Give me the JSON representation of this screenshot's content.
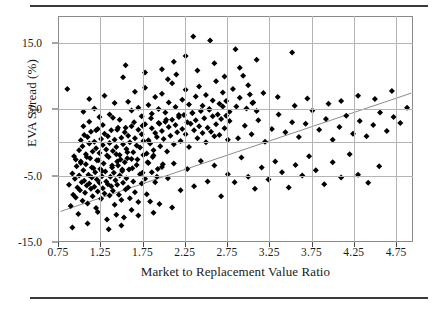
{
  "chart_data": {
    "type": "scatter",
    "title": "",
    "xlabel": "Market to Replacement Value Ratio",
    "ylabel": "EVA Spread (%)",
    "xlim": [
      0.75,
      4.95
    ],
    "ylim": [
      -15.0,
      19.0
    ],
    "grid": true,
    "legend": null,
    "xticks": [
      "0.75",
      "1.25",
      "1.75",
      "2.25",
      "2.75",
      "3.25",
      "3.75",
      "4.25",
      "4.75"
    ],
    "xtick_values": [
      0.75,
      1.25,
      1.75,
      2.25,
      2.75,
      3.25,
      3.75,
      4.25,
      4.75
    ],
    "yticks": [
      "15.0",
      "5.0",
      "-5.0",
      "-15.0"
    ],
    "ytick_values": [
      15.0,
      5.0,
      -5.0,
      -15.0
    ],
    "ygridlines": [
      15.0,
      5.0,
      -5.0
    ],
    "ygridline_unlabeled": [
      0.0
    ],
    "marker": "diamond",
    "marker_color": "#000000",
    "marker_size": 3,
    "trendline": {
      "type": "linear",
      "color": "#8c8c8c",
      "x_start": 0.78,
      "y_start": -10.4,
      "x_end": 4.93,
      "y_end": 7.4
    },
    "points": [
      [
        0.86,
        8.0
      ],
      [
        0.88,
        -6.4
      ],
      [
        0.9,
        -9.6
      ],
      [
        0.92,
        -4.7
      ],
      [
        0.93,
        -7.9
      ],
      [
        0.94,
        -2.1
      ],
      [
        0.95,
        -5.5
      ],
      [
        0.96,
        -8.3
      ],
      [
        0.97,
        -3.6
      ],
      [
        0.98,
        -6.8
      ],
      [
        0.99,
        -10.8
      ],
      [
        1.0,
        -5.0
      ],
      [
        1.01,
        -7.2
      ],
      [
        1.02,
        -2.9
      ],
      [
        1.03,
        -6.0
      ],
      [
        1.04,
        -8.8
      ],
      [
        1.05,
        -4.2
      ],
      [
        1.06,
        -5.8
      ],
      [
        1.07,
        -7.6
      ],
      [
        1.08,
        -3.3
      ],
      [
        1.09,
        -6.5
      ],
      [
        1.1,
        -9.2
      ],
      [
        1.11,
        -4.9
      ],
      [
        1.12,
        -6.2
      ],
      [
        1.13,
        -2.4
      ],
      [
        1.14,
        -7.0
      ],
      [
        1.15,
        -5.3
      ],
      [
        1.16,
        -8.1
      ],
      [
        1.17,
        -3.9
      ],
      [
        1.18,
        -6.7
      ],
      [
        1.19,
        -4.5
      ],
      [
        1.2,
        -9.9
      ],
      [
        1.21,
        -5.6
      ],
      [
        1.22,
        -7.4
      ],
      [
        1.23,
        -2.7
      ],
      [
        1.24,
        -6.1
      ],
      [
        1.25,
        -4.0
      ],
      [
        1.26,
        -8.5
      ],
      [
        1.27,
        -5.1
      ],
      [
        1.28,
        -6.9
      ],
      [
        1.29,
        -3.2
      ],
      [
        1.3,
        -7.7
      ],
      [
        1.31,
        -4.4
      ],
      [
        1.32,
        -5.9
      ],
      [
        1.33,
        -11.6
      ],
      [
        1.34,
        -6.3
      ],
      [
        1.35,
        -2.2
      ],
      [
        1.36,
        -8.0
      ],
      [
        1.37,
        -5.2
      ],
      [
        1.38,
        -6.6
      ],
      [
        1.39,
        -3.8
      ],
      [
        1.4,
        -7.3
      ],
      [
        1.41,
        -4.6
      ],
      [
        1.42,
        -9.4
      ],
      [
        1.43,
        -5.7
      ],
      [
        1.44,
        -1.8
      ],
      [
        1.45,
        -6.4
      ],
      [
        1.46,
        -3.5
      ],
      [
        1.47,
        -7.9
      ],
      [
        1.48,
        -5.0
      ],
      [
        1.49,
        -2.6
      ],
      [
        1.5,
        -8.7
      ],
      [
        1.51,
        -4.3
      ],
      [
        1.52,
        -6.1
      ],
      [
        1.53,
        -11.3
      ],
      [
        1.54,
        -3.0
      ],
      [
        1.55,
        -7.1
      ],
      [
        1.56,
        -5.4
      ],
      [
        1.57,
        -1.5
      ],
      [
        1.58,
        -6.8
      ],
      [
        1.59,
        -4.1
      ],
      [
        1.6,
        -8.4
      ],
      [
        1.62,
        -2.5
      ],
      [
        1.64,
        -5.9
      ],
      [
        1.66,
        -7.5
      ],
      [
        1.68,
        -3.4
      ],
      [
        1.7,
        -9.0
      ],
      [
        1.72,
        -4.8
      ],
      [
        1.74,
        -6.2
      ],
      [
        1.76,
        -1.9
      ],
      [
        1.78,
        -5.5
      ],
      [
        1.8,
        -7.8
      ],
      [
        1.82,
        -3.1
      ],
      [
        1.84,
        -8.9
      ],
      [
        1.86,
        -4.5
      ],
      [
        1.88,
        -2.0
      ],
      [
        1.9,
        -6.0
      ],
      [
        1.92,
        -5.2
      ],
      [
        1.95,
        -9.3
      ],
      [
        1.98,
        -3.7
      ],
      [
        1.0,
        -1.2
      ],
      [
        1.02,
        0.3
      ],
      [
        1.04,
        -0.6
      ],
      [
        1.06,
        1.1
      ],
      [
        1.08,
        -1.8
      ],
      [
        1.1,
        0.8
      ],
      [
        1.12,
        -0.2
      ],
      [
        1.14,
        1.6
      ],
      [
        1.16,
        -1.4
      ],
      [
        1.18,
        0.1
      ],
      [
        1.2,
        -0.9
      ],
      [
        1.22,
        2.0
      ],
      [
        1.24,
        -1.6
      ],
      [
        1.26,
        0.5
      ],
      [
        1.28,
        -0.4
      ],
      [
        1.3,
        1.3
      ],
      [
        1.32,
        -1.1
      ],
      [
        1.34,
        0.9
      ],
      [
        1.36,
        -0.1
      ],
      [
        1.38,
        1.8
      ],
      [
        1.4,
        -1.3
      ],
      [
        1.42,
        0.4
      ],
      [
        1.44,
        -0.7
      ],
      [
        1.46,
        2.2
      ],
      [
        1.48,
        -1.9
      ],
      [
        1.5,
        0.7
      ],
      [
        1.52,
        -0.3
      ],
      [
        1.54,
        1.5
      ],
      [
        1.56,
        -1.0
      ],
      [
        1.58,
        1.0
      ],
      [
        1.6,
        0.0
      ],
      [
        1.62,
        2.4
      ],
      [
        1.64,
        -1.5
      ],
      [
        1.66,
        0.6
      ],
      [
        1.68,
        -0.5
      ],
      [
        1.7,
        1.9
      ],
      [
        1.72,
        -0.8
      ],
      [
        1.74,
        1.2
      ],
      [
        1.76,
        0.2
      ],
      [
        1.78,
        2.7
      ],
      [
        1.8,
        -1.7
      ],
      [
        1.82,
        0.3
      ],
      [
        1.84,
        -0.2
      ],
      [
        1.86,
        2.1
      ],
      [
        1.88,
        -1.2
      ],
      [
        1.9,
        1.4
      ],
      [
        1.92,
        0.8
      ],
      [
        1.94,
        2.9
      ],
      [
        1.96,
        -0.6
      ],
      [
        1.98,
        1.7
      ],
      [
        2.0,
        0.5
      ],
      [
        2.02,
        3.1
      ],
      [
        2.04,
        -1.4
      ],
      [
        2.06,
        2.3
      ],
      [
        2.08,
        1.0
      ],
      [
        2.1,
        3.4
      ],
      [
        2.12,
        -0.3
      ],
      [
        2.14,
        2.6
      ],
      [
        2.16,
        1.5
      ],
      [
        2.18,
        3.8
      ],
      [
        2.2,
        0.2
      ],
      [
        2.22,
        2.0
      ],
      [
        2.24,
        4.1
      ],
      [
        2.26,
        1.2
      ],
      [
        2.28,
        3.0
      ],
      [
        2.3,
        -0.7
      ],
      [
        2.32,
        2.8
      ],
      [
        2.34,
        4.4
      ],
      [
        2.36,
        1.8
      ],
      [
        2.38,
        3.3
      ],
      [
        2.4,
        0.6
      ],
      [
        2.42,
        2.4
      ],
      [
        2.44,
        4.7
      ],
      [
        2.46,
        1.4
      ],
      [
        2.48,
        3.6
      ],
      [
        2.5,
        0.0
      ],
      [
        2.52,
        2.2
      ],
      [
        2.54,
        5.0
      ],
      [
        2.56,
        1.6
      ],
      [
        2.58,
        3.9
      ],
      [
        2.6,
        0.9
      ],
      [
        2.62,
        2.7
      ],
      [
        2.64,
        4.2
      ],
      [
        2.66,
        1.1
      ],
      [
        2.68,
        3.5
      ],
      [
        2.7,
        5.4
      ],
      [
        2.72,
        2.1
      ],
      [
        2.74,
        4.0
      ],
      [
        2.76,
        0.4
      ],
      [
        2.78,
        3.2
      ],
      [
        1.05,
        4.6
      ],
      [
        1.12,
        6.5
      ],
      [
        1.18,
        5.1
      ],
      [
        1.24,
        3.8
      ],
      [
        1.3,
        7.0
      ],
      [
        1.36,
        4.2
      ],
      [
        1.42,
        5.9
      ],
      [
        1.48,
        3.4
      ],
      [
        1.52,
        9.8
      ],
      [
        1.58,
        6.1
      ],
      [
        1.62,
        4.8
      ],
      [
        1.66,
        7.6
      ],
      [
        1.7,
        5.2
      ],
      [
        1.74,
        3.9
      ],
      [
        1.78,
        8.2
      ],
      [
        1.82,
        5.6
      ],
      [
        1.86,
        4.3
      ],
      [
        1.9,
        6.8
      ],
      [
        1.94,
        5.0
      ],
      [
        1.98,
        7.3
      ],
      [
        2.02,
        4.5
      ],
      [
        2.06,
        6.0
      ],
      [
        2.1,
        8.9
      ],
      [
        2.14,
        5.3
      ],
      [
        2.18,
        4.1
      ],
      [
        2.22,
        6.4
      ],
      [
        2.26,
        7.9
      ],
      [
        2.3,
        5.7
      ],
      [
        2.34,
        4.4
      ],
      [
        2.38,
        6.9
      ],
      [
        2.42,
        8.4
      ],
      [
        2.46,
        5.5
      ],
      [
        2.5,
        7.1
      ],
      [
        2.54,
        4.9
      ],
      [
        2.58,
        6.3
      ],
      [
        2.62,
        9.2
      ],
      [
        2.66,
        5.8
      ],
      [
        2.7,
        7.5
      ],
      [
        2.74,
        6.2
      ],
      [
        2.78,
        4.6
      ],
      [
        2.82,
        8.0
      ],
      [
        2.86,
        5.4
      ],
      [
        2.9,
        6.7
      ],
      [
        2.94,
        10.0
      ],
      [
        2.98,
        5.1
      ],
      [
        3.02,
        7.2
      ],
      [
        3.06,
        6.0
      ],
      [
        3.1,
        4.7
      ],
      [
        1.55,
        11.6
      ],
      [
        2.12,
        12.1
      ],
      [
        2.26,
        13.0
      ],
      [
        2.35,
        15.9
      ],
      [
        2.55,
        15.3
      ],
      [
        2.6,
        11.9
      ],
      [
        2.85,
        14.0
      ],
      [
        2.9,
        11.2
      ],
      [
        3.1,
        12.4
      ],
      [
        3.52,
        13.5
      ],
      [
        1.78,
        10.5
      ],
      [
        2.05,
        9.5
      ],
      [
        2.4,
        10.8
      ],
      [
        1.98,
        11.0
      ],
      [
        2.72,
        9.9
      ],
      [
        3.0,
        8.6
      ],
      [
        2.15,
        10.2
      ],
      [
        2.05,
        -5.4
      ],
      [
        2.12,
        -3.2
      ],
      [
        2.2,
        -7.2
      ],
      [
        2.28,
        -4.0
      ],
      [
        2.36,
        -6.6
      ],
      [
        2.44,
        -2.8
      ],
      [
        2.52,
        -5.9
      ],
      [
        2.6,
        -3.5
      ],
      [
        2.68,
        -8.1
      ],
      [
        2.76,
        -4.8
      ],
      [
        2.84,
        -6.0
      ],
      [
        2.92,
        -2.3
      ],
      [
        3.0,
        -5.2
      ],
      [
        3.08,
        -7.0
      ],
      [
        3.16,
        -3.8
      ],
      [
        3.24,
        -5.6
      ],
      [
        3.32,
        -2.9
      ],
      [
        3.4,
        -4.5
      ],
      [
        3.48,
        -6.8
      ],
      [
        3.56,
        -3.4
      ],
      [
        3.64,
        -5.0
      ],
      [
        3.72,
        -2.1
      ],
      [
        3.8,
        -4.2
      ],
      [
        3.9,
        -6.3
      ],
      [
        4.0,
        -3.0
      ],
      [
        4.1,
        -5.3
      ],
      [
        4.2,
        -1.8
      ],
      [
        4.3,
        -4.9
      ],
      [
        4.42,
        -6.1
      ],
      [
        4.55,
        -3.6
      ],
      [
        2.88,
        0.6
      ],
      [
        2.96,
        2.5
      ],
      [
        3.04,
        1.2
      ],
      [
        3.12,
        3.3
      ],
      [
        3.2,
        0.1
      ],
      [
        3.28,
        2.0
      ],
      [
        3.36,
        4.2
      ],
      [
        3.44,
        1.5
      ],
      [
        3.52,
        3.0
      ],
      [
        3.6,
        0.8
      ],
      [
        3.68,
        2.8
      ],
      [
        3.76,
        4.8
      ],
      [
        3.84,
        1.9
      ],
      [
        3.92,
        3.5
      ],
      [
        4.0,
        0.4
      ],
      [
        4.08,
        2.3
      ],
      [
        4.16,
        4.0
      ],
      [
        4.24,
        1.3
      ],
      [
        4.32,
        3.2
      ],
      [
        4.4,
        0.9
      ],
      [
        4.48,
        2.6
      ],
      [
        4.56,
        4.5
      ],
      [
        4.64,
        1.7
      ],
      [
        4.72,
        3.8
      ],
      [
        4.8,
        2.9
      ],
      [
        4.88,
        5.2
      ],
      [
        4.7,
        7.7
      ],
      [
        4.5,
        6.5
      ],
      [
        4.3,
        7.0
      ],
      [
        4.1,
        6.2
      ],
      [
        3.95,
        5.8
      ],
      [
        3.7,
        6.6
      ],
      [
        3.55,
        5.5
      ],
      [
        3.35,
        6.8
      ],
      [
        3.18,
        7.4
      ],
      [
        3.05,
        5.9
      ],
      [
        0.92,
        -12.8
      ],
      [
        1.1,
        -12.2
      ],
      [
        1.35,
        -13.1
      ],
      [
        1.5,
        -12.5
      ],
      [
        1.7,
        -11.0
      ],
      [
        1.22,
        -10.5
      ],
      [
        1.44,
        -10.9
      ],
      [
        1.62,
        -10.2
      ],
      [
        1.88,
        -10.6
      ],
      [
        2.1,
        -9.8
      ],
      [
        1.05,
        2.4
      ],
      [
        1.12,
        3.1
      ],
      [
        1.2,
        1.8
      ],
      [
        1.28,
        2.6
      ],
      [
        1.4,
        3.7
      ],
      [
        1.45,
        1.9
      ],
      [
        1.55,
        2.2
      ],
      [
        1.65,
        3.0
      ],
      [
        1.75,
        2.5
      ],
      [
        1.85,
        3.6
      ],
      [
        1.95,
        2.8
      ],
      [
        2.03,
        3.4
      ],
      [
        0.96,
        -2.6
      ],
      [
        1.02,
        -3.1
      ],
      [
        1.09,
        -2.2
      ],
      [
        1.15,
        -3.8
      ],
      [
        1.21,
        -2.7
      ],
      [
        1.27,
        -4.3
      ],
      [
        1.33,
        -2.0
      ],
      [
        1.39,
        -3.5
      ],
      [
        1.45,
        -2.9
      ],
      [
        1.51,
        -4.1
      ],
      [
        1.57,
        -2.4
      ],
      [
        1.63,
        -3.9
      ],
      [
        1.69,
        -2.6
      ],
      [
        1.75,
        -4.6
      ],
      [
        1.81,
        -3.0
      ],
      [
        1.87,
        -2.2
      ],
      [
        1.93,
        -4.0
      ],
      [
        1.99,
        -3.3
      ]
    ]
  },
  "axes": {
    "x_title": "Market to Replacement Value Ratio",
    "y_title": "EVA Spread (%)"
  }
}
